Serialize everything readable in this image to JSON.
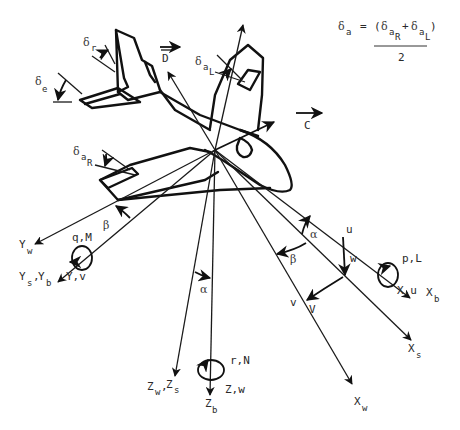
{
  "equation": {
    "lhs_symbol": "δ",
    "lhs_sub": "a",
    "equals": "=",
    "open_paren": "(",
    "term1_symbol": "δ",
    "term1_sub": "a",
    "term1_subsub": "R",
    "plus": "+",
    "term2_symbol": "δ",
    "term2_sub": "a",
    "term2_subsub": "L",
    "close_paren": ")",
    "denominator": "2"
  },
  "control_surfaces": {
    "rudder": {
      "symbol": "δ",
      "sub": "r"
    },
    "elevator": {
      "symbol": "δ",
      "sub": "e"
    },
    "left_aileron": {
      "symbol": "δ",
      "sub": "a",
      "subsub": "L"
    },
    "right_aileron": {
      "symbol": "δ",
      "sub": "a",
      "subsub": "R"
    }
  },
  "forces": {
    "drag": "D",
    "side_force": "C"
  },
  "axes": {
    "x_body": {
      "main": "X",
      "sub": "b"
    },
    "x_stability": {
      "main": "X",
      "sub": "s"
    },
    "x_wind": {
      "main": "X",
      "sub": "w"
    },
    "y_wind": {
      "main": "Y",
      "sub": "w"
    },
    "y_stab_body": {
      "main1": "Y",
      "sub1": "s",
      "sep": ",",
      "main2": "Y",
      "sub2": "b"
    },
    "z_wind_stab": {
      "main1": "Z",
      "sub1": "w",
      "sep": ",",
      "main2": "Z",
      "sub2": "s"
    },
    "z_body": {
      "main": "Z",
      "sub": "b"
    }
  },
  "moments": {
    "roll": "p,L",
    "pitch": "q,M",
    "yaw": "r,N"
  },
  "force_velocity": {
    "x": "X,u",
    "y": "Y,v",
    "z": "Z,w"
  },
  "velocity_components": {
    "u": "u",
    "w": "w",
    "v1": "v",
    "v2": "V"
  },
  "angles": {
    "alpha": "α",
    "beta": "β"
  }
}
